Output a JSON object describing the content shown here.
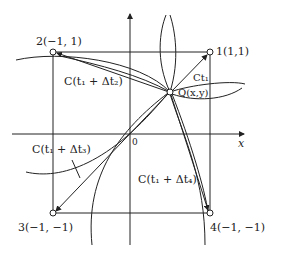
{
  "diagram": {
    "axes": {
      "x_label": "x",
      "origin_label": "0"
    },
    "points": [
      {
        "id": "1",
        "label": "1(1,1)"
      },
      {
        "id": "2",
        "label": "2(−1, 1)"
      },
      {
        "id": "3",
        "label": "3(−1, −1)"
      },
      {
        "id": "4",
        "label": "4(−1, −1)"
      }
    ],
    "center_point": {
      "label": "Q(x,y)"
    },
    "curves": [
      {
        "label": "Ct₁"
      },
      {
        "label": "C(t₁ + Δt₂)"
      },
      {
        "label": "C(t₁ + Δt₃)"
      },
      {
        "label": "C(t₁ + Δt₄)"
      }
    ],
    "colors": {
      "stroke": "#222222",
      "background": "#ffffff"
    }
  }
}
